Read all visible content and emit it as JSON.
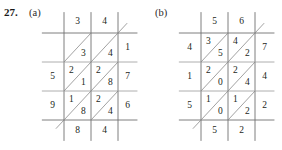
{
  "exercise": {
    "number": "27.",
    "parts": [
      {
        "label": "(a)"
      },
      {
        "label": "(b)"
      }
    ]
  },
  "grids": [
    {
      "id": "grid-a",
      "part": "(a)",
      "columns": 2,
      "rows": 3,
      "top_multiplicand": [
        "3",
        "4"
      ],
      "right_multiplier": [
        "1",
        "7",
        "6"
      ],
      "left_digits": [
        "",
        "5",
        "9"
      ],
      "bottom_digits": [
        "8",
        "4"
      ],
      "cells": [
        [
          {
            "upper": "",
            "lower": "3"
          },
          {
            "upper": "",
            "lower": "4"
          }
        ],
        [
          {
            "upper": "2",
            "lower": "1"
          },
          {
            "upper": "2",
            "lower": "8"
          }
        ],
        [
          {
            "upper": "1",
            "lower": "8"
          },
          {
            "upper": "2",
            "lower": "4"
          }
        ]
      ]
    },
    {
      "id": "grid-b",
      "part": "(b)",
      "columns": 2,
      "rows": 3,
      "top_multiplicand": [
        "5",
        "6"
      ],
      "right_multiplier": [
        "7",
        "4",
        "2"
      ],
      "left_digits": [
        "4",
        "1",
        "5"
      ],
      "bottom_digits": [
        "5",
        "2"
      ],
      "cells": [
        [
          {
            "upper": "3",
            "lower": "5"
          },
          {
            "upper": "4",
            "lower": "2"
          }
        ],
        [
          {
            "upper": "2",
            "lower": "0"
          },
          {
            "upper": "2",
            "lower": "4"
          }
        ],
        [
          {
            "upper": "1",
            "lower": "0"
          },
          {
            "upper": "1",
            "lower": "2"
          }
        ]
      ]
    }
  ],
  "colors": {
    "ink": "#231f20",
    "gridline": "#6f6f6f",
    "diagonal": "#8a8a8a",
    "background": "#ffffff"
  }
}
